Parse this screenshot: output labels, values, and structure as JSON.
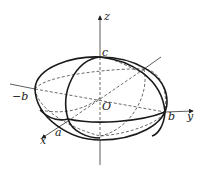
{
  "figure": {
    "colors": {
      "stroke": "#1a1a1a",
      "background": "#ffffff"
    },
    "axes": {
      "x": {
        "label": "x"
      },
      "y": {
        "label": "y"
      },
      "z": {
        "label": "z"
      }
    },
    "points": {
      "origin": "O",
      "c": "c",
      "neg_b": "−b",
      "b": "b",
      "a": "a"
    }
  }
}
